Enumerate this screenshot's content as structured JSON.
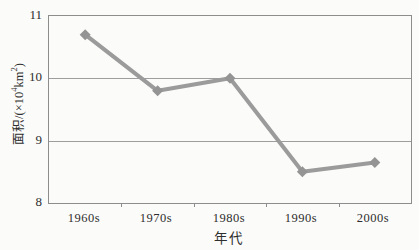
{
  "figure": {
    "background": "#fbfbf9",
    "border_color": "#8d8d8d",
    "gridline_color": "#9d9d9d",
    "line_color": "#9b9b9b",
    "marker_color": "#949494",
    "text_color": "#2e2e2e"
  },
  "chart_data": {
    "type": "line",
    "categories": [
      "1960s",
      "1970s",
      "1980s",
      "1990s",
      "2000s"
    ],
    "values": [
      10.7,
      9.8,
      10.0,
      8.5,
      8.65
    ],
    "title": "",
    "xlabel": "年代",
    "ylabel": "面积/(×10⁴km²)",
    "ylabel_parts": {
      "pre": "面积/(×10",
      "sup1": "4",
      "mid": "km",
      "sup2": "2",
      "post": ")"
    },
    "ytick_labels": [
      "11",
      "10",
      "9",
      "8"
    ],
    "ylim": [
      8,
      11
    ],
    "grid": "horizontal-major",
    "legend": "none",
    "marker": "diamond",
    "line_width": 4
  }
}
